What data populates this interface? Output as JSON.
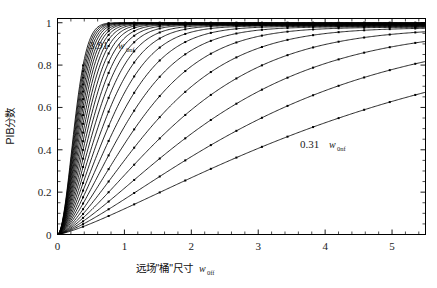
{
  "chart_data": {
    "type": "line",
    "title": "",
    "xlabel": "远场\"桶\"尺寸  w0ff",
    "ylabel": "PIB分数",
    "xlim": [
      0,
      5.5
    ],
    "ylim": [
      0,
      1.02
    ],
    "grid": false,
    "legend_position": "none",
    "x_ticks": [
      0,
      1,
      2,
      3,
      4,
      5
    ],
    "x_tick_labels": [
      "0",
      "1",
      "2",
      "3",
      "4",
      "5"
    ],
    "x_minor_step": 0.2,
    "y_ticks": [
      0,
      0.2,
      0.4,
      0.6,
      0.8,
      1
    ],
    "y_tick_labels": [
      "0",
      "0.2",
      "0.4",
      "0.6",
      "0.8",
      "1"
    ],
    "y_minor_step": 0.05,
    "annotations": [
      {
        "name": "upper-curve-label",
        "value": "3.91",
        "unit": "w",
        "sub": "0nf",
        "x": 0.55,
        "y": 0.87
      },
      {
        "name": "lower-curve-label",
        "value": "0.31",
        "unit": "w",
        "sub": "0nf",
        "x": 3.4,
        "y": 0.44
      }
    ],
    "series_param_name": "w0nf",
    "series_param_min": 0.31,
    "series_param_max": 3.91,
    "series_count": 25,
    "marker": "square",
    "marker_count_per_curve": 14,
    "series": [
      {
        "name": "3.91",
        "param": 3.91,
        "halfwidth": 0.3,
        "shape": 1.95,
        "ceiling": 1.0
      },
      {
        "name": "3.76",
        "param": 3.76,
        "halfwidth": 0.312,
        "shape": 1.93,
        "ceiling": 0.999
      },
      {
        "name": "3.61",
        "param": 3.61,
        "halfwidth": 0.326,
        "shape": 1.91,
        "ceiling": 0.999
      },
      {
        "name": "3.46",
        "param": 3.46,
        "halfwidth": 0.341,
        "shape": 1.89,
        "ceiling": 0.998
      },
      {
        "name": "3.31",
        "param": 3.31,
        "halfwidth": 0.358,
        "shape": 1.87,
        "ceiling": 0.998
      },
      {
        "name": "3.16",
        "param": 3.16,
        "halfwidth": 0.377,
        "shape": 1.85,
        "ceiling": 0.997
      },
      {
        "name": "3.01",
        "param": 3.01,
        "halfwidth": 0.398,
        "shape": 1.83,
        "ceiling": 0.997
      },
      {
        "name": "2.86",
        "param": 2.86,
        "halfwidth": 0.422,
        "shape": 1.81,
        "ceiling": 0.996
      },
      {
        "name": "2.71",
        "param": 2.71,
        "halfwidth": 0.45,
        "shape": 1.79,
        "ceiling": 0.995
      },
      {
        "name": "2.56",
        "param": 2.56,
        "halfwidth": 0.482,
        "shape": 1.77,
        "ceiling": 0.994
      },
      {
        "name": "2.41",
        "param": 2.41,
        "halfwidth": 0.518,
        "shape": 1.75,
        "ceiling": 0.993
      },
      {
        "name": "2.26",
        "param": 2.26,
        "halfwidth": 0.56,
        "shape": 1.73,
        "ceiling": 0.992
      },
      {
        "name": "2.11",
        "param": 2.11,
        "halfwidth": 0.61,
        "shape": 1.71,
        "ceiling": 0.991
      },
      {
        "name": "1.96",
        "param": 1.96,
        "halfwidth": 0.668,
        "shape": 1.69,
        "ceiling": 0.99
      },
      {
        "name": "1.81",
        "param": 1.81,
        "halfwidth": 0.738,
        "shape": 1.67,
        "ceiling": 0.988
      },
      {
        "name": "1.66",
        "param": 1.66,
        "halfwidth": 0.822,
        "shape": 1.65,
        "ceiling": 0.987
      },
      {
        "name": "1.51",
        "param": 1.51,
        "halfwidth": 0.925,
        "shape": 1.63,
        "ceiling": 0.985
      },
      {
        "name": "1.36",
        "param": 1.36,
        "halfwidth": 1.055,
        "shape": 1.6,
        "ceiling": 0.983
      },
      {
        "name": "1.21",
        "param": 1.21,
        "halfwidth": 1.22,
        "shape": 1.57,
        "ceiling": 0.981
      },
      {
        "name": "1.06",
        "param": 1.06,
        "halfwidth": 1.435,
        "shape": 1.54,
        "ceiling": 0.979
      },
      {
        "name": "0.91",
        "param": 0.91,
        "halfwidth": 1.72,
        "shape": 1.5,
        "ceiling": 0.977
      },
      {
        "name": "0.76",
        "param": 0.76,
        "halfwidth": 2.11,
        "shape": 1.45,
        "ceiling": 0.975
      },
      {
        "name": "0.61",
        "param": 0.61,
        "halfwidth": 2.66,
        "shape": 1.4,
        "ceiling": 0.973
      },
      {
        "name": "0.46",
        "param": 0.46,
        "halfwidth": 3.48,
        "shape": 1.34,
        "ceiling": 0.97
      },
      {
        "name": "0.31",
        "param": 0.31,
        "halfwidth": 4.82,
        "shape": 1.28,
        "ceiling": 0.968
      }
    ]
  },
  "axes": {
    "x_title_cn": "远场\"桶\"尺寸",
    "x_title_sym": "w",
    "x_title_sub": "0ff",
    "y_title": "PIB分数"
  },
  "colors": {
    "curve": "#000000",
    "axis": "#000000",
    "background": "#ffffff",
    "text": "#1a1a1a"
  }
}
